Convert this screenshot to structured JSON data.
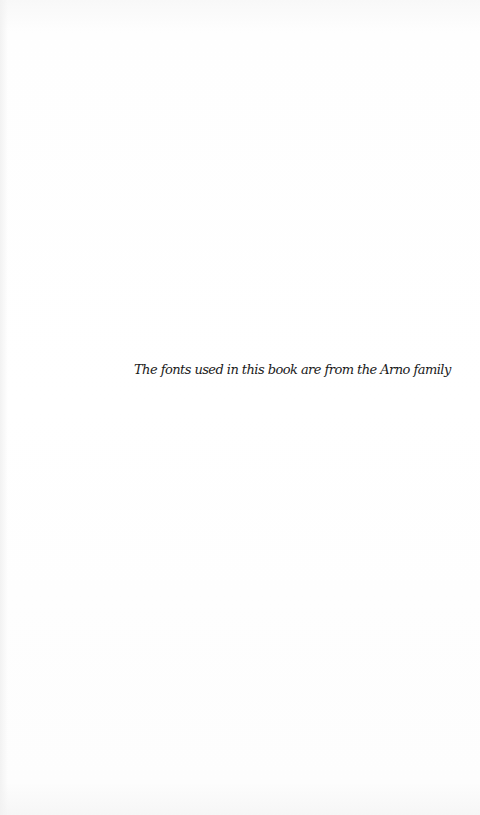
{
  "page": {
    "type": "colophon",
    "background_color": "#ffffff",
    "text_color": "#1a1a1a"
  },
  "colophon": {
    "text": "The fonts used in this book are from the Arno family"
  }
}
